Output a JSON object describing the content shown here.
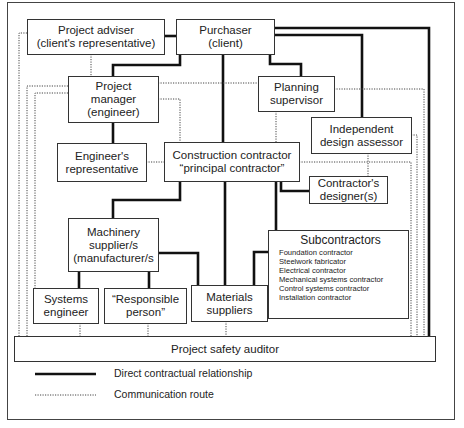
{
  "diagram": {
    "nodes": {
      "project_adviser": {
        "line1": "Project adviser",
        "line2": "(client's representative)"
      },
      "purchaser": {
        "line1": "Purchaser",
        "line2": "(client)"
      },
      "project_manager": {
        "line1": "Project",
        "line2": "manager",
        "line3": "(engineer)"
      },
      "planning_supervisor": {
        "line1": "Planning",
        "line2": "supervisor"
      },
      "independent_design_assessor": {
        "line1": "Independent",
        "line2": "design assessor"
      },
      "engineers_representative": {
        "line1": "Engineer's",
        "line2": "representative"
      },
      "construction_contractor": {
        "line1": "Construction contractor",
        "line2": "“principal contractor”"
      },
      "contractors_designers": {
        "line1": "Contractor's",
        "line2": "designer(s)"
      },
      "machinery_supplier": {
        "line1": "Machinery",
        "line2": "supplier/s",
        "line3": "(manufacturer/s"
      },
      "subcontractors": {
        "title": "Subcontractors",
        "items": [
          "Foundation contractor",
          "Steelwork fabricator",
          "Electrical contractor",
          "Mechanical systems contractor",
          "Control systems contractor",
          "Installation contractor"
        ]
      },
      "systems_engineer": {
        "line1": "Systems",
        "line2": "engineer"
      },
      "responsible_person": {
        "line1": "“Responsible",
        "line2": "person”"
      },
      "materials_suppliers": {
        "line1": "Materials",
        "line2": "suppliers"
      },
      "project_safety_auditor": {
        "line1": "Project safety auditor"
      }
    },
    "legend": {
      "solid": "Direct contractual relationship",
      "dotted": "Communication route"
    },
    "colors": {
      "line": "#111111",
      "box_border": "#333333",
      "background": "#ffffff"
    }
  }
}
